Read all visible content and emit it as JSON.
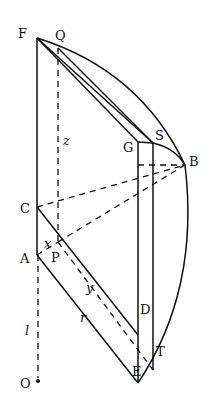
{
  "diagram": {
    "title": "",
    "points": {
      "F": {
        "label": "F",
        "x": 37,
        "y": 38
      },
      "Q": {
        "label": "Q",
        "x": 58,
        "y": 48
      },
      "G": {
        "label": "G",
        "x": 138,
        "y": 142
      },
      "S": {
        "label": "S",
        "x": 153,
        "y": 143
      },
      "B": {
        "label": "B",
        "x": 185,
        "y": 165
      },
      "C": {
        "label": "C",
        "x": 37,
        "y": 207
      },
      "A": {
        "label": "A",
        "x": 37,
        "y": 255
      },
      "P": {
        "label": "P",
        "x": 58,
        "y": 242
      },
      "D": {
        "label": "D",
        "x": 138,
        "y": 335
      },
      "T": {
        "label": "T",
        "x": 153,
        "y": 370
      },
      "E": {
        "label": "E",
        "x": 138,
        "y": 383
      },
      "O": {
        "label": "O",
        "x": 38,
        "y": 381
      }
    },
    "variables": {
      "x": "x",
      "y": "y",
      "z": "z",
      "r": "r",
      "l": "l"
    }
  }
}
